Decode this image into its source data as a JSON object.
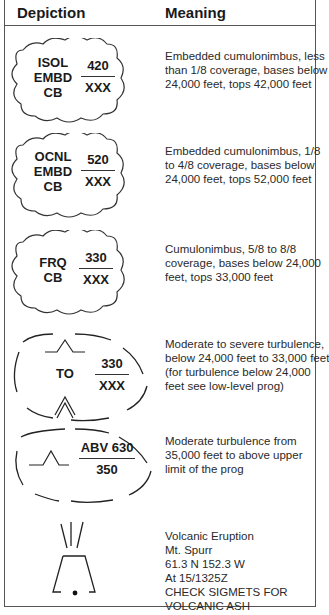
{
  "header": {
    "depiction": "Depiction",
    "meaning": "Meaning"
  },
  "rows": [
    {
      "type": "cloud",
      "label": [
        "ISOL",
        "EMBD",
        "CB"
      ],
      "top": "420",
      "bottom": "XXX",
      "meaning": [
        "Embedded cumulonimbus, less",
        "than 1/8 coverage, bases below",
        "24,000 feet, tops 42,000 feet"
      ]
    },
    {
      "type": "cloud",
      "label": [
        "OCNL",
        "EMBD",
        "CB"
      ],
      "top": "520",
      "bottom": "XXX",
      "meaning": [
        "Embedded cumulonimbus, 1/8",
        "to 4/8 coverage, bases below",
        "24,000 feet, tops 52,000 feet"
      ]
    },
    {
      "type": "cloud",
      "label": [
        "FRQ",
        "CB"
      ],
      "top": "330",
      "bottom": "XXX",
      "meaning": [
        "Cumulonimbus, 5/8 to 8/8",
        "coverage, bases below 24,000",
        "feet, tops 33,000 feet"
      ]
    },
    {
      "type": "turbulence-severe",
      "label": [
        "TO"
      ],
      "top": "330",
      "bottom": "XXX",
      "meaning": [
        "Moderate to severe turbulence,",
        "below 24,000 feet to 33,000 feet",
        "(for turbulence below 24,000",
        "feet see low-level prog)"
      ]
    },
    {
      "type": "turbulence-moderate",
      "top": "ABV 630",
      "bottom": "350",
      "meaning": [
        "Moderate turbulence from",
        "35,000 feet to above upper",
        "limit of the prog"
      ]
    },
    {
      "type": "volcano",
      "meaning": [
        "Volcanic Eruption",
        "Mt. Spurr",
        "61.3 N 152.3 W",
        "At 15/1325Z",
        "CHECK SIGMETS FOR",
        "VOLCANIC ASH"
      ]
    }
  ]
}
